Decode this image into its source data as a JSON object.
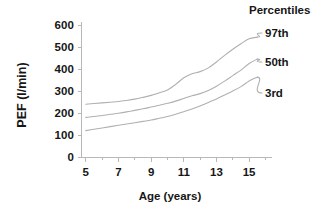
{
  "chart_data": {
    "type": "line",
    "title": "",
    "xlabel": "Age (years)",
    "ylabel": "PEF (l/min)",
    "xlim": [
      4.4,
      16.4
    ],
    "ylim": [
      0,
      600
    ],
    "grid": false,
    "legend_position": "right",
    "legend_title": "Percentiles",
    "x_ticks": [
      5,
      7,
      9,
      11,
      13,
      15
    ],
    "x_tick_labels": [
      "5",
      "7",
      "9",
      "11",
      "13",
      "15"
    ],
    "x_minor_ticks": [
      6,
      8,
      10,
      12,
      14,
      16
    ],
    "y_ticks": [
      0,
      100,
      200,
      300,
      400,
      500,
      600
    ],
    "y_tick_labels": [
      "0",
      "100",
      "200",
      "300",
      "400",
      "500",
      "600"
    ],
    "x": [
      5,
      5.5,
      6,
      6.5,
      7,
      7.5,
      8,
      8.5,
      9,
      9.5,
      10,
      10.5,
      11,
      11.5,
      12,
      12.5,
      13,
      13.5,
      14,
      14.5,
      15,
      15.5
    ],
    "series": [
      {
        "name": "97th",
        "label": "97th",
        "color": "#b0b0b0",
        "values": [
          240,
          243,
          246,
          249,
          252,
          257,
          263,
          271,
          280,
          292,
          305,
          330,
          360,
          378,
          388,
          405,
          432,
          462,
          490,
          515,
          537,
          545
        ]
      },
      {
        "name": "50th",
        "label": "50th",
        "color": "#b0b0b0",
        "values": [
          180,
          184,
          189,
          194,
          199,
          205,
          212,
          219,
          227,
          235,
          244,
          254,
          266,
          278,
          288,
          302,
          322,
          345,
          370,
          395,
          425,
          445
        ]
      },
      {
        "name": "3rd",
        "label": "3rd",
        "color": "#b0b0b0",
        "values": [
          120,
          126,
          132,
          138,
          144,
          150,
          156,
          162,
          168,
          176,
          184,
          194,
          206,
          218,
          232,
          248,
          264,
          282,
          300,
          320,
          345,
          363
        ]
      }
    ]
  },
  "legend": {
    "title": "Percentiles",
    "entries": [
      {
        "label": "97th"
      },
      {
        "label": "50th"
      },
      {
        "label": "3rd"
      }
    ]
  },
  "axes": {
    "x_title": "Age (years)",
    "y_title": "PEF (l/min)"
  }
}
